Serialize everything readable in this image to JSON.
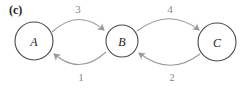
{
  "panel_label": "(c)",
  "colors": {
    "node_stroke": "#4a4a4a",
    "edge_stroke": "#9a9a9a",
    "edge_label": "#8a8a8a",
    "text": "#222222"
  },
  "nodes": [
    {
      "id": "A",
      "label": "A"
    },
    {
      "id": "B",
      "label": "B"
    },
    {
      "id": "C",
      "label": "C"
    }
  ],
  "edges": [
    {
      "from": "A",
      "to": "B",
      "label": "3"
    },
    {
      "from": "B",
      "to": "A",
      "label": "1"
    },
    {
      "from": "B",
      "to": "C",
      "label": "4"
    },
    {
      "from": "C",
      "to": "B",
      "label": "2"
    }
  ]
}
